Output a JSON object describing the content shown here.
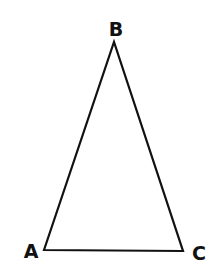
{
  "diagram": {
    "type": "triangle",
    "stroke_color": "#111111",
    "background": "#ffffff",
    "vertices": [
      {
        "label": "A",
        "x": 44,
        "y": 250,
        "label_x": 31,
        "label_y": 258
      },
      {
        "label": "B",
        "x": 114,
        "y": 42,
        "label_x": 116,
        "label_y": 36
      },
      {
        "label": "C",
        "x": 183,
        "y": 251,
        "label_x": 199,
        "label_y": 260
      }
    ],
    "edges": [
      {
        "from": "A",
        "to": "B"
      },
      {
        "from": "B",
        "to": "C"
      },
      {
        "from": "C",
        "to": "A"
      }
    ]
  }
}
